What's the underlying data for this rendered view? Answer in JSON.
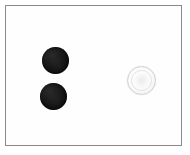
{
  "image": {
    "title": "Photograph of three round objects on a white background",
    "background_color": "#ffffff",
    "frame_color": "#8a8a8a",
    "width": 190,
    "height": 155
  },
  "frame": {
    "label": "Photo border",
    "x": 5,
    "y": 5,
    "width": 177,
    "height": 141
  },
  "objects": [
    {
      "id": "dark-disc-top",
      "label": "Black round object (upper left)",
      "color": "#101010",
      "shape": "circle",
      "center_x": 55,
      "center_y": 60,
      "diameter": 27
    },
    {
      "id": "dark-disc-bottom",
      "label": "Black round object (lower left)",
      "color": "#101010",
      "shape": "circle",
      "center_x": 53,
      "center_y": 96,
      "diameter": 27
    },
    {
      "id": "pale-coin",
      "label": "Pale silver coin (right)",
      "color": "#f5f5f5",
      "shape": "circle",
      "center_x": 141,
      "center_y": 80,
      "diameter": 29
    }
  ]
}
